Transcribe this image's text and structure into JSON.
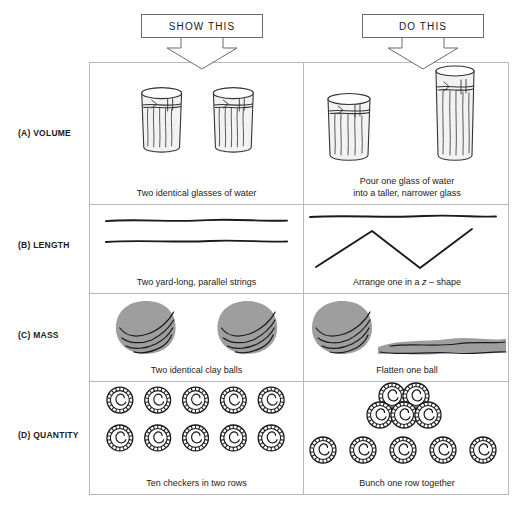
{
  "figure": {
    "headers": [
      {
        "id": "show-this",
        "label": "SHOW THIS"
      },
      {
        "id": "do-this",
        "label": "DO THIS"
      }
    ],
    "rows": [
      {
        "id": "volume",
        "label": "(A) VOLUME",
        "show": {
          "caption": "Two identical glasses of water",
          "art": "two-identical-short-glasses"
        },
        "do": {
          "caption_line1": "Pour one glass of water",
          "caption_line2": "into a taller, narrower glass",
          "art": "short-glass-and-tall-narrow-glass"
        }
      },
      {
        "id": "length",
        "label": "(B) LENGTH",
        "show": {
          "caption": "Two yard-long, parallel strings",
          "art": "two-parallel-straight-strings"
        },
        "do": {
          "caption_pre": "Arrange one in a ",
          "caption_italic": "z",
          "caption_post": " – shape",
          "art": "straight-string-and-zigzag-string"
        }
      },
      {
        "id": "mass",
        "label": "(C) MASS",
        "show": {
          "caption": "Two identical clay balls",
          "art": "two-round-clay-balls"
        },
        "do": {
          "caption": "Flatten one ball",
          "art": "clay-ball-and-flattened-pancake"
        }
      },
      {
        "id": "quantity",
        "label": "(D) QUANTITY",
        "show": {
          "caption": "Ten checkers in two rows",
          "art": "two-rows-of-five-checkers",
          "checkers_total": 10,
          "checkers_per_row": 5,
          "checker_rows": 2
        },
        "do": {
          "caption": "Bunch one row together",
          "art": "bunched-cluster-and-spread-row",
          "bunched_count": 5,
          "spread_count": 5
        }
      }
    ],
    "figure_caption": "",
    "colors": {
      "border": "#b9b9b9",
      "callout_border": "#6b6b6b",
      "ink": "#111111",
      "clay_fill": "#9e9e9e",
      "glass_fill": "#efefef"
    }
  }
}
